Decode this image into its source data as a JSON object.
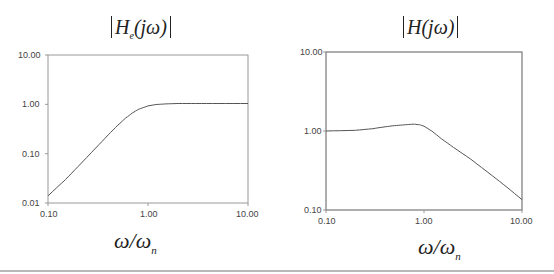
{
  "chart_data": [
    {
      "type": "line",
      "title": "|H_e(jω)|",
      "title_parts": {
        "base": "H",
        "sub": "e",
        "arg": "(jω)"
      },
      "xlabel": "ω/ω_n",
      "ylabel": "",
      "xscale": "log",
      "yscale": "log",
      "xlim": [
        0.1,
        10
      ],
      "ylim": [
        0.01,
        10
      ],
      "x_ticks": [
        "0.10",
        "1.00",
        "10.00"
      ],
      "y_ticks": [
        "10.00",
        "1.00",
        "0.10",
        "0.01"
      ],
      "grid": false,
      "series": [
        {
          "name": "|H_e(jω)|",
          "x": [
            0.1,
            0.15,
            0.2,
            0.3,
            0.4,
            0.5,
            0.6,
            0.7,
            0.8,
            1.0,
            1.2,
            1.5,
            2.0,
            3.0,
            5.0,
            10.0
          ],
          "y": [
            0.014,
            0.03,
            0.055,
            0.13,
            0.24,
            0.38,
            0.53,
            0.67,
            0.79,
            0.93,
            0.99,
            1.02,
            1.04,
            1.04,
            1.04,
            1.04
          ]
        }
      ]
    },
    {
      "type": "line",
      "title": "|H(jω)|",
      "title_parts": {
        "base": "H",
        "sub": "",
        "arg": "(jω)"
      },
      "xlabel": "ω/ω_n",
      "ylabel": "",
      "xscale": "log",
      "yscale": "log",
      "xlim": [
        0.1,
        10
      ],
      "ylim": [
        0.1,
        10
      ],
      "x_ticks": [
        "0.10",
        "1.00",
        "10.00"
      ],
      "y_ticks": [
        "10.00",
        "1.00",
        "0.10"
      ],
      "grid": false,
      "series": [
        {
          "name": "|H(jω)|",
          "x": [
            0.1,
            0.2,
            0.3,
            0.4,
            0.5,
            0.6,
            0.7,
            0.8,
            0.9,
            1.0,
            1.2,
            1.5,
            2.0,
            3.0,
            5.0,
            7.0,
            10.0
          ],
          "y": [
            1.0,
            1.02,
            1.07,
            1.13,
            1.17,
            1.19,
            1.21,
            1.22,
            1.2,
            1.15,
            1.0,
            0.8,
            0.62,
            0.44,
            0.27,
            0.195,
            0.135
          ]
        }
      ]
    }
  ],
  "left": {
    "title_base": "H",
    "title_sub": "e",
    "title_arg": "(jω)",
    "xlabel_main": "ω/ω",
    "xlabel_sub": "n",
    "x_ticks": [
      "0.10",
      "1.00",
      "10.00"
    ],
    "y_ticks": [
      "10.00",
      "1.00",
      "0.10",
      "0.01"
    ]
  },
  "right": {
    "title_base": "H",
    "title_arg": "(jω)",
    "xlabel_main": "ω/ω",
    "xlabel_sub": "n",
    "x_ticks": [
      "0.10",
      "1.00",
      "10.00"
    ],
    "y_ticks": [
      "10.00",
      "1.00",
      "0.10"
    ]
  }
}
